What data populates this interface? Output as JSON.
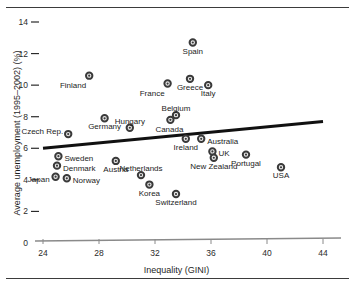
{
  "figure": {
    "width": 353,
    "height": 286,
    "background": "#ffffff",
    "frame_line_color": "#3b3b3b"
  },
  "chart_data": {
    "type": "scatter",
    "title": "",
    "xlabel": "Inequality (GINI)",
    "ylabel": "Average unemployment (1995–2002) (%)",
    "xlim": [
      24,
      44
    ],
    "ylim": [
      0,
      14
    ],
    "xticks": [
      24,
      28,
      32,
      36,
      40,
      44
    ],
    "yticks": [
      0,
      2,
      4,
      6,
      8,
      10,
      12,
      14
    ],
    "grid": false,
    "legend": "none",
    "marker_style": {
      "shape": "donut",
      "ring_color": "#3a3a3a",
      "fill_color": "#ffffff",
      "radius": 3.2
    },
    "trendline": {
      "label": "",
      "color": "#111111",
      "width": 3,
      "x_start": 24,
      "y_start": 6.0,
      "x_end": 44,
      "y_end": 7.7
    },
    "points": [
      {
        "name": "Spain",
        "x": 34.7,
        "y": 12.7,
        "label_pos": "below"
      },
      {
        "name": "Finland",
        "x": 27.3,
        "y": 10.6,
        "label_pos": "left-below"
      },
      {
        "name": "Greece",
        "x": 34.5,
        "y": 10.4,
        "label_pos": "below"
      },
      {
        "name": "France",
        "x": 32.9,
        "y": 10.1,
        "label_pos": "left-below"
      },
      {
        "name": "Italy",
        "x": 35.8,
        "y": 10.0,
        "label_pos": "below"
      },
      {
        "name": "Belgium",
        "x": 33.5,
        "y": 8.1,
        "label_pos": "above"
      },
      {
        "name": "Germany",
        "x": 28.4,
        "y": 7.9,
        "label_pos": "below"
      },
      {
        "name": "Canada",
        "x": 33.1,
        "y": 7.8,
        "label_pos": "below-left"
      },
      {
        "name": "Hungary",
        "x": 30.2,
        "y": 7.3,
        "label_pos": "above"
      },
      {
        "name": "Czech Rep.",
        "x": 25.8,
        "y": 6.9,
        "label_pos": "left-above"
      },
      {
        "name": "Ireland",
        "x": 34.2,
        "y": 6.6,
        "label_pos": "below"
      },
      {
        "name": "Australia",
        "x": 35.3,
        "y": 6.6,
        "label_pos": "right"
      },
      {
        "name": "UK",
        "x": 36.1,
        "y": 5.8,
        "label_pos": "right"
      },
      {
        "name": "Sweden",
        "x": 25.1,
        "y": 5.5,
        "label_pos": "right"
      },
      {
        "name": "Portugal",
        "x": 38.5,
        "y": 5.6,
        "label_pos": "below"
      },
      {
        "name": "New Zealand",
        "x": 36.2,
        "y": 5.4,
        "label_pos": "below"
      },
      {
        "name": "Austria",
        "x": 29.2,
        "y": 5.2,
        "label_pos": "below"
      },
      {
        "name": "Denmark",
        "x": 25.0,
        "y": 4.9,
        "label_pos": "right"
      },
      {
        "name": "USA",
        "x": 41.0,
        "y": 4.8,
        "label_pos": "below"
      },
      {
        "name": "Netherlands",
        "x": 31.0,
        "y": 4.3,
        "label_pos": "above"
      },
      {
        "name": "Japan",
        "x": 24.9,
        "y": 4.2,
        "label_pos": "left"
      },
      {
        "name": "Norway",
        "x": 25.7,
        "y": 4.1,
        "label_pos": "right"
      },
      {
        "name": "Korea",
        "x": 31.6,
        "y": 3.7,
        "label_pos": "below"
      },
      {
        "name": "Switzerland",
        "x": 33.5,
        "y": 3.1,
        "label_pos": "below"
      }
    ]
  }
}
